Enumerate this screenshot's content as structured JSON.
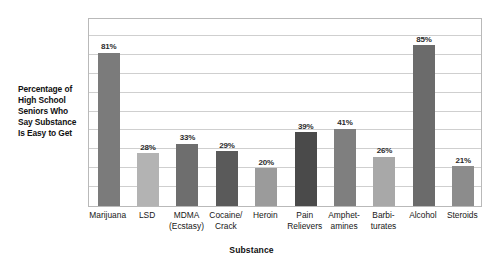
{
  "chart_data": {
    "type": "bar",
    "title": "",
    "subtitle": "",
    "xlabel": "Substance",
    "ylabel": "Percentage of High School Seniors Who Say Substance Is Easy to Get",
    "ylabel_lines": [
      "Percentage of",
      "High School",
      "Seniors Who",
      "Say Substance",
      "Is Easy to Get"
    ],
    "categories": [
      "Marijuana",
      "LSD",
      "MDMA (Ecstasy)",
      "Cocaine/ Crack",
      "Heroin",
      "Pain Relievers",
      "Amphetamines",
      "Barbiturates",
      "Alcohol",
      "Steroids"
    ],
    "category_lines": [
      [
        "Marijuana"
      ],
      [
        "LSD"
      ],
      [
        "MDMA",
        "(Ecstasy)"
      ],
      [
        "Cocaine/",
        "Crack"
      ],
      [
        "Heroin"
      ],
      [
        "Pain",
        "Relievers"
      ],
      [
        "Amphet-",
        "amines"
      ],
      [
        "Barbi-",
        "turates"
      ],
      [
        "Alcohol"
      ],
      [
        "Steroids"
      ]
    ],
    "values": [
      81,
      28,
      33,
      29,
      20,
      39,
      41,
      26,
      85,
      21
    ],
    "value_labels": [
      "81%",
      "28%",
      "33%",
      "29%",
      "20%",
      "39%",
      "41%",
      "26%",
      "85%",
      "21%"
    ],
    "bar_colors": [
      "#7b7b7b",
      "#b3b3b3",
      "#6e6e6e",
      "#5a5a5a",
      "#9b9b9b",
      "#4a4a4a",
      "#7f7f7f",
      "#a8a8a8",
      "#6b6b6b",
      "#8c8c8c"
    ],
    "ylim": [
      0,
      100
    ],
    "y_tick_values": [
      0,
      10,
      20,
      30,
      40,
      50,
      60,
      70,
      80,
      90,
      100
    ],
    "y_tick_labels_shown": false,
    "grid": true,
    "grid_axis": "y",
    "grid_color": "#cfcfcf",
    "frame_color": "#b9b9b9",
    "legend": false,
    "legend_position": "none",
    "data_labels_shown": true,
    "background_color": "#ffffff"
  }
}
